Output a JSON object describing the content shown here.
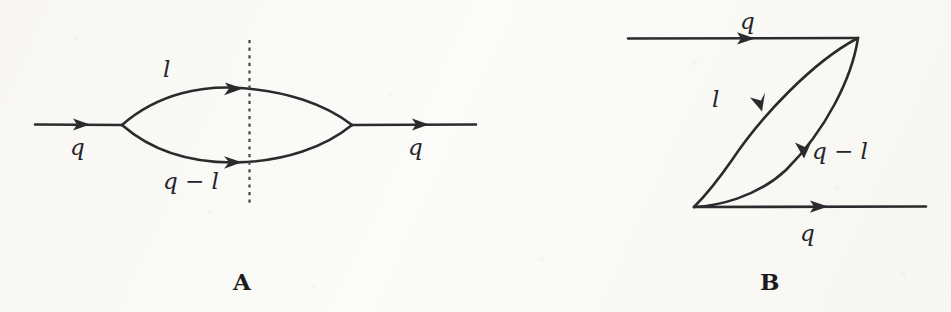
{
  "figure": {
    "type": "feynman-diagram-pair",
    "background_color": "#fbfbf9",
    "ink_color": "#2b2b2d",
    "panels": [
      {
        "id": "A",
        "caption": "A",
        "caption_pos": {
          "x": 233,
          "y": 270
        },
        "description": "self-energy bubble with vertical cut",
        "labels": [
          {
            "name": "incoming-momentum",
            "text": "q",
            "x": 70,
            "y": 136
          },
          {
            "name": "upper-loop-momentum",
            "text": "l",
            "x": 163,
            "y": 58
          },
          {
            "name": "lower-loop-momentum",
            "text": "q − l",
            "x": 163,
            "y": 170
          },
          {
            "name": "outgoing-momentum",
            "text": "q",
            "x": 408,
            "y": 136
          }
        ],
        "geometry": {
          "left_vertex": {
            "x": 122,
            "y": 125
          },
          "right_vertex": {
            "x": 352,
            "y": 125
          },
          "incoming_line_start_x": 35,
          "outgoing_line_end_x": 476,
          "upper_arc_apex_y": 87,
          "lower_arc_apex_y": 163,
          "cut_line_x": 249,
          "cut_line_top_y": 40,
          "cut_line_bottom_y": 206
        }
      },
      {
        "id": "B",
        "caption": "B",
        "caption_pos": {
          "x": 760,
          "y": 270
        },
        "description": "crossed / box-like loop between two external lines",
        "labels": [
          {
            "name": "top-incoming-momentum",
            "text": "q",
            "x": 740,
            "y": 10
          },
          {
            "name": "left-loop-momentum",
            "text": "l",
            "x": 712,
            "y": 88
          },
          {
            "name": "right-loop-momentum",
            "text": "q − l",
            "x": 812,
            "y": 140
          },
          {
            "name": "bottom-outgoing-momentum",
            "text": "q",
            "x": 800,
            "y": 222
          }
        ],
        "geometry": {
          "top_vertex": {
            "x": 858,
            "y": 38
          },
          "bottom_vertex": {
            "x": 694,
            "y": 207
          },
          "top_line_start_x": 628,
          "bottom_line_end_x": 926,
          "left_arc_bulge": -46,
          "right_arc_bulge": 44
        }
      }
    ]
  }
}
